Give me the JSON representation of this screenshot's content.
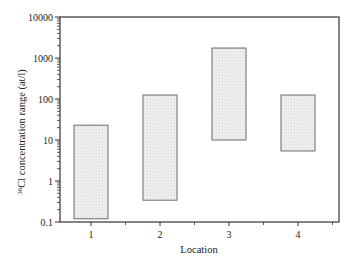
{
  "chart_data": {
    "type": "bar",
    "subtype": "floating-range",
    "title": "",
    "xlabel": "Location",
    "ylabel_sup": "36",
    "ylabel": "Cl concentration range (at/l)",
    "yscale": "log",
    "ylim": [
      0.1,
      10000
    ],
    "yticks": [
      {
        "value": 0.1,
        "label": "0.1"
      },
      {
        "value": 1,
        "label": "1"
      },
      {
        "value": 10,
        "label": "10"
      },
      {
        "value": 100,
        "label": "100"
      },
      {
        "value": 1000,
        "label": "1000"
      },
      {
        "value": 10000,
        "label": "10000"
      }
    ],
    "categories": [
      "1",
      "2",
      "3",
      "4"
    ],
    "series": [
      {
        "name": "min",
        "values": [
          0.12,
          0.34,
          10,
          5.4
        ]
      },
      {
        "name": "max",
        "values": [
          23,
          125,
          1750,
          125
        ]
      }
    ],
    "grid": false,
    "legend": null,
    "colors": {
      "box_fill": "#ececec",
      "box_stroke": "#6b6b6b",
      "axis": "#333333"
    }
  }
}
